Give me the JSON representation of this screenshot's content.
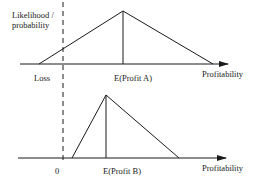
{
  "diagram": {
    "y_axis_label_line1": "Likelihood /",
    "y_axis_label_line2": "probability",
    "top_panel": {
      "x_axis_label": "Profitability",
      "loss_label": "Loss",
      "expected_label": "E(Profit A)",
      "distribution": "triangular, wide spread including losses"
    },
    "bottom_panel": {
      "x_axis_label": "Profitability",
      "zero_label": "0",
      "expected_label": "E(Profit B)",
      "distribution": "triangular, narrow spread, all positive"
    },
    "colors": {
      "line": "#1a1a1a",
      "background": "#ffffff"
    }
  }
}
